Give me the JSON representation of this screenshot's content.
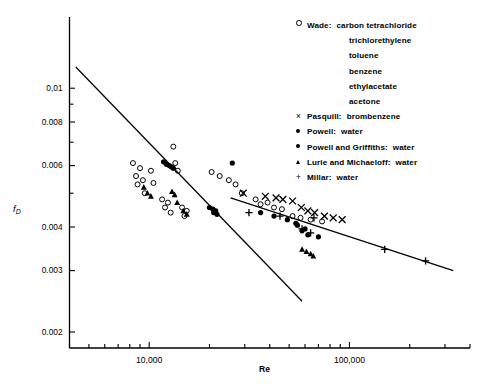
{
  "chart_data": {
    "type": "scatter",
    "title": "",
    "xlabel": "Re",
    "ylabel": "f_D",
    "ylabel_main": "f",
    "ylabel_sub": "D",
    "xscale": "log",
    "yscale": "log",
    "xlim": [
      4000,
      400000
    ],
    "ylim": [
      0.0018,
      0.016
    ],
    "grid": false,
    "xticks_major": [
      {
        "value": 10000,
        "label": "10,000"
      },
      {
        "value": 100000,
        "label": "100,000"
      }
    ],
    "yticks_major": [
      {
        "value": 0.01,
        "label": "0,01"
      },
      {
        "value": 0.008,
        "label": "0.008"
      },
      {
        "value": 0.006,
        "label": "0.006"
      },
      {
        "value": 0.004,
        "label": "0.004"
      },
      {
        "value": 0.003,
        "label": "0.003"
      },
      {
        "value": 0.002,
        "label": "0.002"
      }
    ],
    "legend_position": "top-right",
    "legend": [
      {
        "marker": "open-circle",
        "author": "Wade:",
        "substances": [
          "carbon tetrachloride",
          "trichlorethylene",
          "toluene",
          "benzene",
          "ethylacetate",
          "acetone"
        ]
      },
      {
        "marker": "cross-x",
        "author": "Pasquill:",
        "substances": [
          "brombenzene"
        ]
      },
      {
        "marker": "filled-circle",
        "author": "Powell:",
        "substances": [
          "water"
        ]
      },
      {
        "marker": "filled-circle",
        "author": "Powell and Griffiths:",
        "substances": [
          "water"
        ]
      },
      {
        "marker": "filled-triangle",
        "author": "Lurie and Michaeloff:",
        "substances": [
          "water"
        ]
      },
      {
        "marker": "plus",
        "author": "Millar:",
        "substances": [
          "water"
        ]
      }
    ],
    "trend_lines": [
      {
        "name": "steep-line",
        "x": [
          4300,
          58000
        ],
        "y": [
          0.0115,
          0.00245
        ]
      },
      {
        "name": "shallow-line",
        "x": [
          25500,
          330000
        ],
        "y": [
          0.00485,
          0.003
        ]
      }
    ],
    "series": [
      {
        "name": "Wade",
        "marker": "open-circle",
        "points": [
          [
            8300,
            0.0061
          ],
          [
            8600,
            0.0056
          ],
          [
            8750,
            0.0053
          ],
          [
            9000,
            0.0059
          ],
          [
            9300,
            0.00545
          ],
          [
            9500,
            0.005
          ],
          [
            10200,
            0.0058
          ],
          [
            10500,
            0.00535
          ],
          [
            11600,
            0.0048
          ],
          [
            12000,
            0.00455
          ],
          [
            12400,
            0.0047
          ],
          [
            12800,
            0.0044
          ],
          [
            13200,
            0.0068
          ],
          [
            13500,
            0.0061
          ],
          [
            13900,
            0.0058
          ],
          [
            14600,
            0.00455
          ],
          [
            15000,
            0.0043
          ],
          [
            15400,
            0.00445
          ],
          [
            20500,
            0.00575
          ],
          [
            22500,
            0.0056
          ],
          [
            25000,
            0.00545
          ],
          [
            27000,
            0.0053
          ],
          [
            29000,
            0.005
          ],
          [
            34000,
            0.0048
          ],
          [
            36000,
            0.00465
          ],
          [
            39000,
            0.0047
          ],
          [
            42000,
            0.00455
          ],
          [
            46000,
            0.0045
          ],
          [
            52000,
            0.0043
          ],
          [
            57000,
            0.00425
          ],
          [
            64000,
            0.0042
          ],
          [
            73000,
            0.00415
          ]
        ]
      },
      {
        "name": "Pasquill",
        "marker": "cross-x",
        "points": [
          [
            29500,
            0.005
          ],
          [
            38000,
            0.0049
          ],
          [
            43000,
            0.00485
          ],
          [
            46500,
            0.0048
          ],
          [
            52000,
            0.00475
          ],
          [
            57500,
            0.00455
          ],
          [
            62000,
            0.00445
          ],
          [
            67000,
            0.0044
          ],
          [
            75000,
            0.0043
          ],
          [
            83000,
            0.00425
          ],
          [
            92000,
            0.0042
          ]
        ]
      },
      {
        "name": "Powell",
        "marker": "filled-circle",
        "points": [
          [
            11800,
            0.00615
          ],
          [
            12200,
            0.00605
          ],
          [
            12600,
            0.006
          ],
          [
            20000,
            0.00455
          ],
          [
            20800,
            0.0045
          ],
          [
            21500,
            0.00445
          ],
          [
            26000,
            0.0061
          ],
          [
            36000,
            0.0044
          ],
          [
            42000,
            0.0043
          ],
          [
            49000,
            0.0042
          ],
          [
            54000,
            0.0041
          ],
          [
            58000,
            0.0039
          ],
          [
            62000,
            0.0038
          ],
          [
            70000,
            0.00375
          ]
        ]
      },
      {
        "name": "Powell and Griffiths",
        "marker": "filled-circle",
        "points": [
          [
            12900,
            0.00595
          ],
          [
            13200,
            0.0059
          ],
          [
            21000,
            0.0044
          ],
          [
            21800,
            0.00435
          ],
          [
            55000,
            0.00405
          ],
          [
            60000,
            0.00395
          ]
        ]
      },
      {
        "name": "Lurie and Michaeloff",
        "marker": "filled-triangle",
        "points": [
          [
            9400,
            0.0052
          ],
          [
            9800,
            0.005
          ],
          [
            10200,
            0.0049
          ],
          [
            13000,
            0.00505
          ],
          [
            13400,
            0.00495
          ],
          [
            13800,
            0.0047
          ],
          [
            14800,
            0.00445
          ],
          [
            15400,
            0.00435
          ],
          [
            58000,
            0.00345
          ],
          [
            61000,
            0.0034
          ],
          [
            64000,
            0.00335
          ],
          [
            66000,
            0.0033
          ]
        ]
      },
      {
        "name": "Millar",
        "marker": "plus",
        "points": [
          [
            31500,
            0.0044
          ],
          [
            45000,
            0.0043
          ],
          [
            58000,
            0.00395
          ],
          [
            64000,
            0.00385
          ],
          [
            66500,
            0.00425
          ],
          [
            150000,
            0.00345
          ],
          [
            240000,
            0.0032
          ]
        ]
      }
    ]
  }
}
